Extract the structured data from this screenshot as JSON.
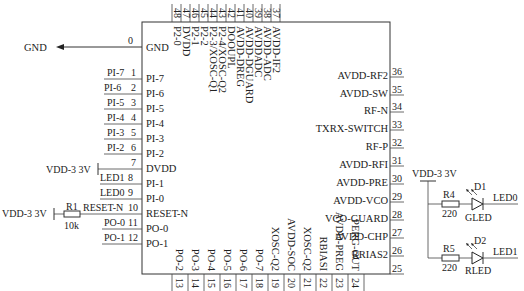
{
  "diagram": {
    "type": "schematic",
    "chip": {
      "left_pins": [
        {
          "num": "0",
          "name": "GND",
          "net": "GND"
        },
        {
          "num": "1",
          "name": "PI-7",
          "net": "PI-7"
        },
        {
          "num": "2",
          "name": "PI-6",
          "net": "PI-6"
        },
        {
          "num": "3",
          "name": "PI-5",
          "net": "PI-5"
        },
        {
          "num": "4",
          "name": "PI-4",
          "net": "PI-4"
        },
        {
          "num": "5",
          "name": "PI-3",
          "net": "PI-3"
        },
        {
          "num": "6",
          "name": "PI-2",
          "net": "PI-2"
        },
        {
          "num": "7",
          "name": "DVDD",
          "net": ""
        },
        {
          "num": "8",
          "name": "PI-1",
          "net": "LED1"
        },
        {
          "num": "9",
          "name": "PI-0",
          "net": "LED0"
        },
        {
          "num": "10",
          "name": "RESET-N",
          "net": "RESET-N"
        },
        {
          "num": "11",
          "name": "PO-0",
          "net": "PO-0"
        },
        {
          "num": "12",
          "name": "PO-1",
          "net": "PO-1"
        }
      ],
      "bottom_pins": [
        {
          "num": "13",
          "name": "PO-2"
        },
        {
          "num": "14",
          "name": "PO-3"
        },
        {
          "num": "15",
          "name": "PO-4"
        },
        {
          "num": "16",
          "name": "PO-5"
        },
        {
          "num": "17",
          "name": "PO-6"
        },
        {
          "num": "18",
          "name": "PO-7"
        },
        {
          "num": "19",
          "name": "XOSC-Q2"
        },
        {
          "num": "20",
          "name": "AVDD-SOC"
        },
        {
          "num": "21",
          "name": "XOSC-Q2"
        },
        {
          "num": "22",
          "name": "RBIASI"
        },
        {
          "num": "23",
          "name": "AVDD-PREG"
        },
        {
          "num": "24",
          "name": "PERG-OUT"
        }
      ],
      "right_pins": [
        {
          "num": "36",
          "name": "AVDD-RF2"
        },
        {
          "num": "35",
          "name": "AVDD-SW"
        },
        {
          "num": "34",
          "name": "RF-N"
        },
        {
          "num": "33",
          "name": "TXRX-SWITCH"
        },
        {
          "num": "32",
          "name": "RF-P"
        },
        {
          "num": "31",
          "name": "AVDD-RFI"
        },
        {
          "num": "30",
          "name": "AVDD-PRE"
        },
        {
          "num": "29",
          "name": "AVDD-VCO"
        },
        {
          "num": "28",
          "name": "VCO-GUARD"
        },
        {
          "num": "27",
          "name": "AVDD-CHP"
        },
        {
          "num": "26",
          "name": "RRIAS2"
        },
        {
          "num": "25",
          "name": "AVDD-IFI"
        }
      ],
      "top_pins": [
        {
          "num": "48",
          "name": "P2-0"
        },
        {
          "num": "47",
          "name": "DVDD"
        },
        {
          "num": "46",
          "name": "P2-1"
        },
        {
          "num": "45",
          "name": "P2-2"
        },
        {
          "num": "44",
          "name": "P2-3/XOSC-Q1"
        },
        {
          "num": "43",
          "name": "P2-4/XOSC-Q2"
        },
        {
          "num": "42",
          "name": "DOOUPL"
        },
        {
          "num": "41",
          "name": "AVDD-DREG"
        },
        {
          "num": "40",
          "name": "AVDD-DGUARD"
        },
        {
          "num": "39",
          "name": "AVDDADC"
        },
        {
          "num": "38",
          "name": "AVDD-ADC"
        },
        {
          "num": "37",
          "name": "AVDD-IF2"
        }
      ]
    },
    "gnd_label": "GND",
    "vdd_dvdd": "VDD-3 3V",
    "vdd_reset": "VDD-3 3V",
    "r1": {
      "ref": "R1",
      "value": "10k"
    },
    "led_circuit": {
      "vdd": "VDD-3 3V",
      "r4": {
        "ref": "R4",
        "value": "220"
      },
      "r5": {
        "ref": "R5",
        "value": "220"
      },
      "d1": {
        "ref": "D1",
        "type": "GLED",
        "net": "LED0"
      },
      "d2": {
        "ref": "D2",
        "type": "RLED",
        "net": "LED1"
      }
    }
  }
}
